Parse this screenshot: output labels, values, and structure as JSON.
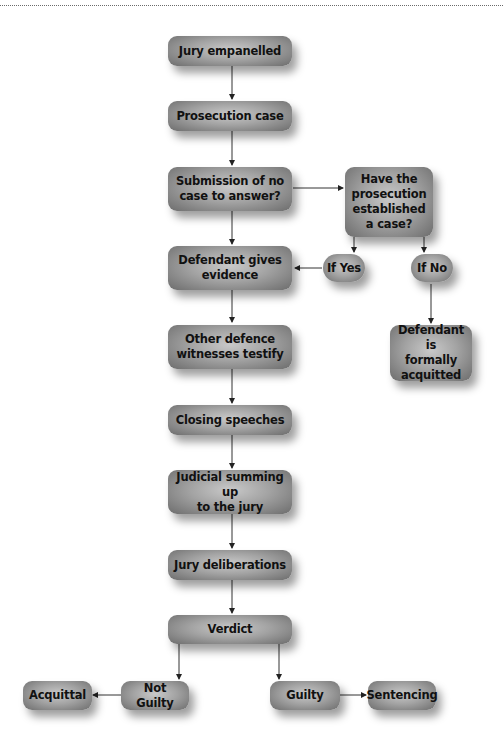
{
  "diagram": {
    "type": "flowchart",
    "nodes": {
      "jury_empanelled": "Jury empanelled",
      "prosecution_case": "Prosecution case",
      "submission": "Submission of no case to answer?",
      "submission_l1": "Submission of no",
      "submission_l2": "case to answer?",
      "established": "Have the prosecution established a case?",
      "established_l1": "Have the",
      "established_l2": "prosecution",
      "established_l3": "established",
      "established_l4": "a case?",
      "if_yes": "If Yes",
      "if_no": "If No",
      "defendant_evidence_l1": "Defendant gives",
      "defendant_evidence_l2": "evidence",
      "acquitted_l1": "Defendant is",
      "acquitted_l2": "formally",
      "acquitted_l3": "acquitted",
      "other_defence_l1": "Other defence",
      "other_defence_l2": "witnesses testify",
      "closing_speeches": "Closing speeches",
      "summing_up_l1": "Judicial summing up",
      "summing_up_l2": "to the jury",
      "jury_deliberations": "Jury deliberations",
      "verdict": "Verdict",
      "not_guilty": "Not Guilty",
      "acquittal": "Acquittal",
      "guilty": "Guilty",
      "sentencing": "Sentencing"
    },
    "edges": [
      [
        "Jury empanelled",
        "Prosecution case"
      ],
      [
        "Prosecution case",
        "Submission of no case to answer?"
      ],
      [
        "Submission of no case to answer?",
        "Defendant gives evidence"
      ],
      [
        "Submission of no case to answer?",
        "Have the prosecution established a case?"
      ],
      [
        "Have the prosecution established a case?",
        "If Yes"
      ],
      [
        "Have the prosecution established a case?",
        "If No"
      ],
      [
        "If Yes",
        "Defendant gives evidence"
      ],
      [
        "If No",
        "Defendant is formally acquitted"
      ],
      [
        "Defendant gives evidence",
        "Other defence witnesses testify"
      ],
      [
        "Other defence witnesses testify",
        "Closing speeches"
      ],
      [
        "Closing speeches",
        "Judicial summing up to the jury"
      ],
      [
        "Judicial summing up to the jury",
        "Jury deliberations"
      ],
      [
        "Jury deliberations",
        "Verdict"
      ],
      [
        "Verdict",
        "Not Guilty"
      ],
      [
        "Verdict",
        "Guilty"
      ],
      [
        "Not Guilty",
        "Acquittal"
      ],
      [
        "Guilty",
        "Sentencing"
      ]
    ]
  }
}
